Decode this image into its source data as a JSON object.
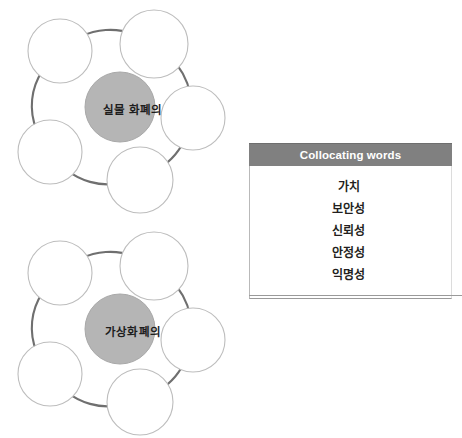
{
  "diagrams": [
    {
      "id": "physical-currency-cluster",
      "hub_label": "실물 화폐의",
      "satellite_count": 5,
      "satellite_labels": [
        "",
        "",
        "",
        "",
        ""
      ]
    },
    {
      "id": "virtual-currency-cluster",
      "hub_label": "가상화폐의",
      "satellite_count": 5,
      "satellite_labels": [
        "",
        "",
        "",
        "",
        ""
      ]
    }
  ],
  "table": {
    "header": "Collocating words",
    "rows": [
      "가치",
      "보안성",
      "신뢰성",
      "안정성",
      "익명성"
    ]
  },
  "colors": {
    "header_bg": "#808080",
    "header_text": "#ffffff",
    "hub_fill": "#b5b5b5",
    "node_fill": "#ffffff",
    "node_stroke": "#bdbdbd",
    "ring_stroke": "#6f6f6f",
    "page_bg": "#ffffff"
  }
}
